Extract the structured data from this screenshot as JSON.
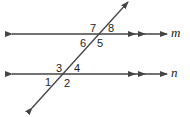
{
  "diagram": {
    "colors": {
      "line": "#444444",
      "text": "#222222",
      "background": "#ffffff"
    },
    "lines": [
      {
        "name": "m",
        "label": "m",
        "y": 34,
        "parallel_marks": 2
      },
      {
        "name": "n",
        "label": "n",
        "y": 74,
        "parallel_marks": 2
      }
    ],
    "transversal": {
      "from": [
        32,
        108
      ],
      "to": [
        128,
        2
      ]
    },
    "angles": [
      {
        "label": "1",
        "line": "n",
        "position": "bottom-left"
      },
      {
        "label": "2",
        "line": "n",
        "position": "bottom-right"
      },
      {
        "label": "3",
        "line": "n",
        "position": "top-left"
      },
      {
        "label": "4",
        "line": "n",
        "position": "top-right"
      },
      {
        "label": "5",
        "line": "m",
        "position": "bottom-right"
      },
      {
        "label": "6",
        "line": "m",
        "position": "bottom-left"
      },
      {
        "label": "7",
        "line": "m",
        "position": "top-left"
      },
      {
        "label": "8",
        "line": "m",
        "position": "top-right"
      }
    ]
  }
}
